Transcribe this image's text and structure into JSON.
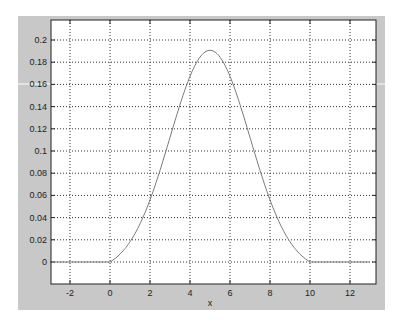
{
  "chart_data": {
    "type": "line",
    "title": "",
    "xlabel": "x",
    "ylabel": "",
    "xlim": [
      -3,
      13.3
    ],
    "ylim": [
      -0.02,
      0.2198
    ],
    "grid": true,
    "legend": null,
    "x_ticks": [
      -2,
      0,
      2,
      4,
      6,
      8,
      10,
      12
    ],
    "x_tick_labels": [
      "-2",
      "0",
      "2",
      "4",
      "6",
      "8",
      "10",
      "12"
    ],
    "y_ticks": [
      0,
      0.02,
      0.04,
      0.06,
      0.08,
      0.1,
      0.12,
      0.14,
      0.16,
      0.18,
      0.2
    ],
    "y_tick_labels": [
      "0",
      "0.02",
      "0.04",
      "0.06",
      "0.08",
      "0.1",
      "0.12",
      "0.14",
      "0.16",
      "0.18",
      "0.2"
    ],
    "series": [
      {
        "name": "normal pdf (mean 5, std 2)",
        "color": "#7a7a7a",
        "x": [
          -3,
          -2,
          -1,
          0,
          1,
          2,
          3,
          4,
          5,
          6,
          7,
          8,
          9,
          10,
          11,
          12,
          13
        ],
        "values": [
          0.0,
          0.0,
          0.0,
          0.0088,
          0.027,
          0.0648,
          0.121,
          0.176,
          0.1995,
          0.176,
          0.121,
          0.0648,
          0.027,
          0.0088,
          0.0,
          0.0,
          0.0
        ]
      }
    ],
    "curve_params": {
      "mean": 5,
      "std": 2,
      "x_start": 0,
      "x_end": 10,
      "flat_left_from": -3,
      "flat_right_to": 13
    }
  },
  "colors": {
    "figure_background": "#c8c8c8",
    "axes_background": "#ffffff",
    "grid": "#333333",
    "curve": "#7a7a7a"
  }
}
